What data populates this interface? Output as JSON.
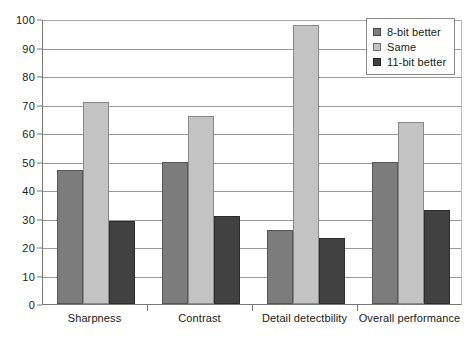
{
  "chart_data": {
    "type": "bar",
    "title": "",
    "subtitle": "",
    "xlabel": "",
    "ylabel": "",
    "ylim": [
      0,
      100
    ],
    "ytick_step": 10,
    "yticks": [
      "0",
      "10",
      "20",
      "30",
      "40",
      "50",
      "60",
      "70",
      "80",
      "90",
      "100"
    ],
    "grid": true,
    "grid_axis": "y",
    "legend_position": "top-right",
    "categories": [
      "Sharpness",
      "Contrast",
      "Detail detectbility",
      "Overall performance"
    ],
    "series": [
      {
        "name": "8-bit better",
        "color": "#7c7c7c",
        "values": [
          47,
          50,
          26,
          50
        ]
      },
      {
        "name": "Same",
        "color": "#c3c3c3",
        "values": [
          71,
          66,
          98,
          64
        ]
      },
      {
        "name": "11-bit better",
        "color": "#414141",
        "values": [
          29,
          31,
          23,
          33
        ]
      }
    ]
  },
  "legend": {
    "items": [
      {
        "label": "8-bit better",
        "swatch": "legend-swatch-8bit-better"
      },
      {
        "label": "Same",
        "swatch": "legend-swatch-same"
      },
      {
        "label": "11-bit better",
        "swatch": "legend-swatch-11bit-better"
      }
    ]
  },
  "colors": {
    "series_8bit": "#7c7c7c",
    "series_same": "#c3c3c3",
    "series_11bit": "#414141",
    "gridline": "#9a9a9a",
    "axis": "#777777",
    "background": "#ffffff",
    "text": "#1a1a1a"
  }
}
